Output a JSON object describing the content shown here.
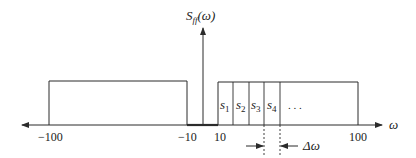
{
  "figure": {
    "y_label": "S",
    "y_label_sub": "ff",
    "y_label_arg": "(ω)",
    "x_label": "ω",
    "ticks": [
      {
        "label": "−100",
        "value": -100
      },
      {
        "label": "−10",
        "value": -10
      },
      {
        "label": "10",
        "value": 10
      },
      {
        "label": "100",
        "value": 100
      }
    ],
    "bands": [
      {
        "label": "negative band",
        "from": -100,
        "to": -10
      },
      {
        "label": "positive band",
        "from": 10,
        "to": 100
      }
    ],
    "segments": [
      {
        "name": "s",
        "sub": "1"
      },
      {
        "name": "s",
        "sub": "2"
      },
      {
        "name": "s",
        "sub": "3"
      },
      {
        "name": "s",
        "sub": "4"
      }
    ],
    "ellipsis": ". . .",
    "delta_label": "Δω",
    "colors": {
      "stroke": "#2b2b2b",
      "text": "#222222",
      "background": "#ffffff"
    }
  }
}
